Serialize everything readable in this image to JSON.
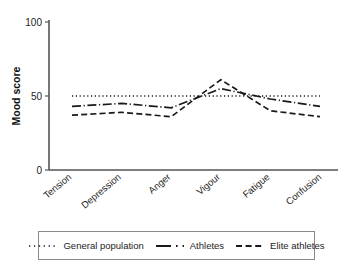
{
  "chart_data": {
    "type": "line",
    "title": "",
    "xlabel": "",
    "ylabel": "Mood score",
    "categories": [
      "Tension",
      "Depression",
      "Anger",
      "Vigour",
      "Fatigue",
      "Confusion"
    ],
    "ylim": [
      0,
      100
    ],
    "yticks": [
      0,
      50,
      100
    ],
    "ytick_labels": [
      "0",
      "50",
      "100"
    ],
    "grid": false,
    "legend_position": "bottom",
    "series": [
      {
        "name": "General population",
        "line_style": "dotted",
        "color": "#1a1a1a",
        "values": [
          50,
          50,
          50,
          50,
          50,
          50
        ]
      },
      {
        "name": "Athletes",
        "line_style": "dash-dot",
        "color": "#1a1a1a",
        "values": [
          43,
          45,
          42,
          55,
          48,
          43
        ]
      },
      {
        "name": "Elite athletes",
        "line_style": "dashed",
        "color": "#1a1a1a",
        "values": [
          37,
          39,
          36,
          61,
          40,
          36
        ]
      }
    ]
  },
  "axis": {
    "y_label": "Mood score",
    "y_ticks": [
      "100",
      "50",
      "0"
    ]
  },
  "categories": {
    "c0": "Tension",
    "c1": "Depression",
    "c2": "Anger",
    "c3": "Vigour",
    "c4": "Fatigue",
    "c5": "Confusion"
  },
  "legend": {
    "items": [
      {
        "label": "General population",
        "style": "dotted"
      },
      {
        "label": "Athletes",
        "style": "dash-dot"
      },
      {
        "label": "Elite athletes",
        "style": "dashed"
      }
    ],
    "item0": "General population",
    "item1": "Athletes",
    "item2": "Elite athletes"
  }
}
